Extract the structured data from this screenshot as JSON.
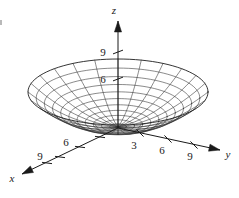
{
  "figure": {
    "kind": "3d-wireframe-surface-plot",
    "background_color": "#ffffff",
    "line_color": "#2b2b2b",
    "label_color": "#1a1a1a"
  },
  "axes": [
    {
      "id": "x",
      "label": "x",
      "label_x": 12,
      "label_y": 182,
      "start": {
        "x": 118,
        "y": 128
      },
      "end": {
        "x": 22,
        "y": 174
      },
      "arrow": true,
      "ticks": [
        {
          "value": "",
          "x": 100,
          "y": 137
        },
        {
          "value": "6",
          "x": 80,
          "y": 147,
          "label_x": 66,
          "label_y": 146
        },
        {
          "value": "",
          "x": 60,
          "y": 157
        },
        {
          "value": "9",
          "x": 47,
          "y": 163,
          "label_x": 40,
          "label_y": 160
        }
      ]
    },
    {
      "id": "y",
      "label": "y",
      "label_x": 228,
      "label_y": 158,
      "start": {
        "x": 118,
        "y": 128
      },
      "end": {
        "x": 220,
        "y": 150
      },
      "arrow": true,
      "ticks": [
        {
          "value": "3",
          "x": 140,
          "y": 133,
          "label_x": 134,
          "label_y": 149
        },
        {
          "value": "6",
          "x": 168,
          "y": 139,
          "label_x": 162,
          "label_y": 154
        },
        {
          "value": "9",
          "x": 194,
          "y": 145,
          "label_x": 190,
          "label_y": 160
        }
      ]
    },
    {
      "id": "z",
      "label": "z",
      "label_x": 114,
      "label_y": 14,
      "start": {
        "x": 118,
        "y": 128
      },
      "end": {
        "x": 118,
        "y": 21
      },
      "arrow": true,
      "ticks": [
        {
          "value": "6",
          "x": 118,
          "y": 79,
          "label_x": 103,
          "label_y": 83
        },
        {
          "value": "9",
          "x": 118,
          "y": 52,
          "label_x": 103,
          "label_y": 56
        }
      ]
    }
  ],
  "chart_data": {
    "type": "surface",
    "title": "",
    "xlabel": "x",
    "ylabel": "y",
    "zlabel": "z",
    "surface_equation": "z = x^2 + y^2",
    "xlim": [
      -10,
      10
    ],
    "ylim": [
      -10,
      10
    ],
    "zlim": [
      0,
      10
    ],
    "x_ticks": [
      6,
      9
    ],
    "y_ticks": [
      3,
      6,
      9
    ],
    "z_ticks": [
      6,
      9
    ],
    "grid": false,
    "legend": null,
    "mesh": {
      "radial_spokes": 24,
      "concentric_rings": 11,
      "vertex": {
        "x": 118,
        "y": 127
      },
      "rim_center": {
        "x": 118,
        "y": 92
      },
      "rim_radius_x": 90,
      "rim_radius_y": 33,
      "rim_height": 35
    }
  }
}
